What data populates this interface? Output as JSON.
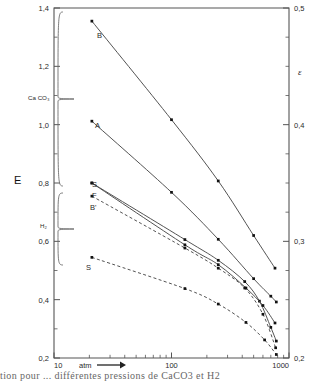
{
  "figure": {
    "caption_fragment": "tion  pour  ... différentes  pressions  de  CaCO3  et  H2"
  },
  "chart_data": {
    "type": "line",
    "title": "",
    "xlabel": "atm",
    "ylabel": "E",
    "y2label": "ε",
    "xscale": "log",
    "xlim": [
      10,
      1000
    ],
    "ylim": [
      0.2,
      1.4
    ],
    "y2lim": [
      0.2,
      0.5
    ],
    "grid": false,
    "legend": "inline-curve-labels",
    "xticks": [
      10,
      100,
      1000
    ],
    "xticklabels": [
      "10",
      "100",
      "1000"
    ],
    "yticks": [
      0.2,
      0.4,
      0.6,
      0.8,
      1.0,
      1.2,
      1.4
    ],
    "yticklabels": [
      "0,2",
      "0,4",
      "0,6",
      "0,8",
      "1,0",
      "1,2",
      "1,4"
    ],
    "y2ticks": [
      0.2,
      0.3,
      0.4,
      0.5
    ],
    "y2ticklabels": [
      "0,2",
      "0,3",
      "0,4",
      "0,5"
    ],
    "group_labels": [
      {
        "name": "CaCO3",
        "text": "Ca CO₃",
        "curves": [
          "B",
          "A",
          "S"
        ]
      },
      {
        "name": "H2",
        "text": "H₂",
        "curves": [
          "F",
          "B'",
          "S"
        ]
      }
    ],
    "series": [
      {
        "name": "B",
        "label": "B",
        "group": "CaCO3",
        "style": "solid",
        "points": [
          {
            "x": 21,
            "y": 1.355
          },
          {
            "x": 100,
            "y": 1.017
          },
          {
            "x": 250,
            "y": 0.807
          },
          {
            "x": 500,
            "y": 0.62
          },
          {
            "x": 760,
            "y": 0.508
          }
        ]
      },
      {
        "name": "A",
        "label": "A",
        "group": "CaCO3",
        "style": "solid",
        "points": [
          {
            "x": 21,
            "y": 1.012
          },
          {
            "x": 100,
            "y": 0.768
          },
          {
            "x": 250,
            "y": 0.607
          },
          {
            "x": 500,
            "y": 0.472
          },
          {
            "x": 700,
            "y": 0.412
          },
          {
            "x": 780,
            "y": 0.392
          }
        ]
      },
      {
        "name": "S-CaCO3",
        "label": "S",
        "group": "CaCO3",
        "style": "solid",
        "points": [
          {
            "x": 21,
            "y": 0.8
          },
          {
            "x": 130,
            "y": 0.606
          },
          {
            "x": 250,
            "y": 0.535
          },
          {
            "x": 420,
            "y": 0.462
          },
          {
            "x": 560,
            "y": 0.395
          },
          {
            "x": 700,
            "y": 0.305
          },
          {
            "x": 780,
            "y": 0.258
          }
        ]
      },
      {
        "name": "F",
        "label": "F",
        "group": "H2",
        "style": "solid",
        "points": [
          {
            "x": 21,
            "y": 0.8
          },
          {
            "x": 130,
            "y": 0.588
          },
          {
            "x": 250,
            "y": 0.52
          },
          {
            "x": 430,
            "y": 0.44
          },
          {
            "x": 600,
            "y": 0.38
          },
          {
            "x": 760,
            "y": 0.32
          }
        ]
      },
      {
        "name": "B-prime",
        "label": "B'",
        "group": "H2",
        "style": "dashed",
        "points": [
          {
            "x": 21,
            "y": 0.755
          },
          {
            "x": 130,
            "y": 0.577
          },
          {
            "x": 250,
            "y": 0.508
          },
          {
            "x": 420,
            "y": 0.44
          },
          {
            "x": 600,
            "y": 0.35
          },
          {
            "x": 770,
            "y": 0.235
          }
        ]
      },
      {
        "name": "S-H2",
        "label": "S",
        "group": "H2",
        "style": "dashed",
        "points": [
          {
            "x": 21,
            "y": 0.545
          },
          {
            "x": 130,
            "y": 0.438
          },
          {
            "x": 250,
            "y": 0.385
          },
          {
            "x": 430,
            "y": 0.322
          },
          {
            "x": 620,
            "y": 0.262
          },
          {
            "x": 780,
            "y": 0.212
          }
        ]
      }
    ],
    "colors": {
      "axis": "#555555",
      "curve": "#4a4a4a",
      "marker": "#111111",
      "text": "#2a2a2a",
      "background": "#ffffff"
    }
  }
}
